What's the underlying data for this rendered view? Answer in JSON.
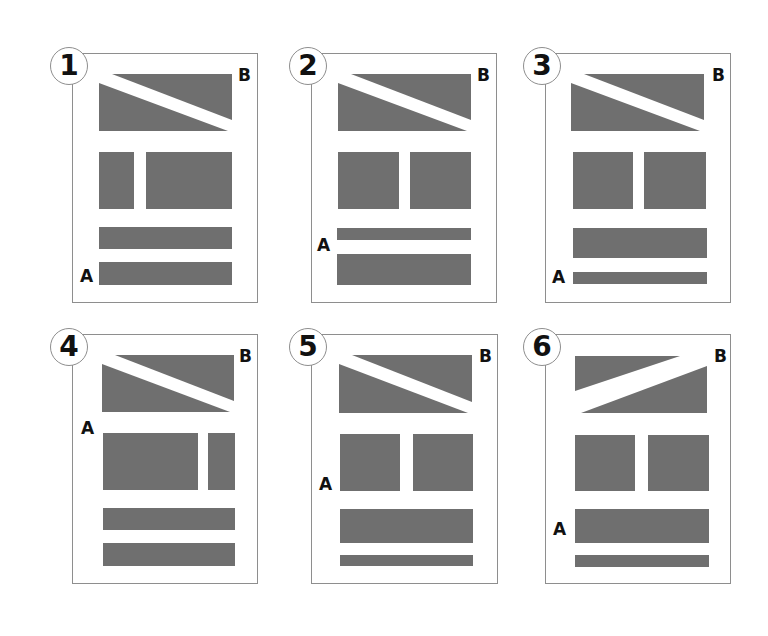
{
  "colors": {
    "block": "#6f6f6f",
    "border": "#8e8e8e",
    "text": "#111111",
    "background": "#ffffff"
  },
  "panels": [
    {
      "number": "1",
      "label_a": "A",
      "label_b": "B",
      "diagonal": "down",
      "box": {
        "x": 72,
        "y": 53,
        "w": 186,
        "h": 250
      },
      "circle": {
        "x": 50,
        "y": 47
      },
      "b_pos": {
        "x": 238,
        "y": 67
      },
      "a_pos": {
        "x": 80,
        "y": 268
      },
      "top_block": {
        "x": 99,
        "y": 74,
        "w": 133,
        "h": 57
      },
      "col_left": {
        "x": 99,
        "y": 152,
        "w": 35,
        "h": 57
      },
      "col_right": {
        "x": 146,
        "y": 152,
        "w": 86,
        "h": 57
      },
      "bar1": {
        "x": 99,
        "y": 227,
        "w": 133,
        "h": 22
      },
      "bar2": {
        "x": 99,
        "y": 262,
        "w": 133,
        "h": 23
      }
    },
    {
      "number": "2",
      "label_a": "A",
      "label_b": "B",
      "diagonal": "down",
      "box": {
        "x": 311,
        "y": 53,
        "w": 186,
        "h": 250
      },
      "circle": {
        "x": 289,
        "y": 47
      },
      "b_pos": {
        "x": 477,
        "y": 67
      },
      "a_pos": {
        "x": 317,
        "y": 237
      },
      "top_block": {
        "x": 338,
        "y": 74,
        "w": 133,
        "h": 57
      },
      "col_left": {
        "x": 338,
        "y": 152,
        "w": 61,
        "h": 57
      },
      "col_right": {
        "x": 410,
        "y": 152,
        "w": 61,
        "h": 57
      },
      "bar1": {
        "x": 337,
        "y": 228,
        "w": 134,
        "h": 12
      },
      "bar2": {
        "x": 337,
        "y": 254,
        "w": 134,
        "h": 31
      }
    },
    {
      "number": "3",
      "label_a": "A",
      "label_b": "B",
      "diagonal": "down",
      "box": {
        "x": 545,
        "y": 53,
        "w": 186,
        "h": 250
      },
      "circle": {
        "x": 523,
        "y": 47
      },
      "b_pos": {
        "x": 712,
        "y": 67
      },
      "a_pos": {
        "x": 552,
        "y": 269
      },
      "top_block": {
        "x": 571,
        "y": 74,
        "w": 133,
        "h": 57
      },
      "col_left": {
        "x": 573,
        "y": 152,
        "w": 60,
        "h": 57
      },
      "col_right": {
        "x": 644,
        "y": 152,
        "w": 62,
        "h": 57
      },
      "bar1": {
        "x": 573,
        "y": 228,
        "w": 134,
        "h": 30
      },
      "bar2": {
        "x": 573,
        "y": 272,
        "w": 134,
        "h": 12
      }
    },
    {
      "number": "4",
      "label_a": "A",
      "label_b": "B",
      "diagonal": "down",
      "box": {
        "x": 72,
        "y": 334,
        "w": 186,
        "h": 250
      },
      "circle": {
        "x": 50,
        "y": 328
      },
      "b_pos": {
        "x": 239,
        "y": 348
      },
      "a_pos": {
        "x": 81,
        "y": 420
      },
      "top_block": {
        "x": 102,
        "y": 355,
        "w": 132,
        "h": 57
      },
      "col_left": {
        "x": 103,
        "y": 433,
        "w": 95,
        "h": 57
      },
      "col_right": {
        "x": 208,
        "y": 433,
        "w": 27,
        "h": 57
      },
      "bar1": {
        "x": 103,
        "y": 508,
        "w": 132,
        "h": 22
      },
      "bar2": {
        "x": 103,
        "y": 543,
        "w": 132,
        "h": 23
      }
    },
    {
      "number": "5",
      "label_a": "A",
      "label_b": "B",
      "diagonal": "down",
      "box": {
        "x": 311,
        "y": 334,
        "w": 187,
        "h": 250
      },
      "circle": {
        "x": 289,
        "y": 328
      },
      "b_pos": {
        "x": 479,
        "y": 348
      },
      "a_pos": {
        "x": 319,
        "y": 476
      },
      "top_block": {
        "x": 339,
        "y": 355,
        "w": 133,
        "h": 58
      },
      "col_left": {
        "x": 340,
        "y": 434,
        "w": 60,
        "h": 57
      },
      "col_right": {
        "x": 413,
        "y": 434,
        "w": 60,
        "h": 57
      },
      "bar1": {
        "x": 340,
        "y": 509,
        "w": 133,
        "h": 34
      },
      "bar2": {
        "x": 340,
        "y": 555,
        "w": 133,
        "h": 11
      }
    },
    {
      "number": "6",
      "label_a": "A",
      "label_b": "B",
      "diagonal": "up",
      "box": {
        "x": 545,
        "y": 334,
        "w": 186,
        "h": 250
      },
      "circle": {
        "x": 523,
        "y": 328
      },
      "b_pos": {
        "x": 714,
        "y": 348
      },
      "a_pos": {
        "x": 553,
        "y": 521
      },
      "top_block": {
        "x": 575,
        "y": 356,
        "w": 132,
        "h": 57
      },
      "col_left": {
        "x": 575,
        "y": 435,
        "w": 60,
        "h": 56
      },
      "col_right": {
        "x": 648,
        "y": 435,
        "w": 61,
        "h": 56
      },
      "bar1": {
        "x": 575,
        "y": 509,
        "w": 134,
        "h": 34
      },
      "bar2": {
        "x": 575,
        "y": 555,
        "w": 134,
        "h": 12
      }
    }
  ]
}
